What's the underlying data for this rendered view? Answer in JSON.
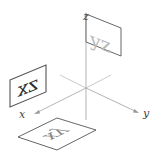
{
  "diagram": {
    "type": "3d-coordinate-projection-planes",
    "axes": [
      {
        "name": "x",
        "label": "x"
      },
      {
        "name": "y",
        "label": "y"
      },
      {
        "name": "z",
        "label": "z"
      }
    ],
    "planes": [
      {
        "name": "yz",
        "text": "yz",
        "color": "#b8b8b8",
        "orientation": "vertical, parallel to y-z plane, behind z-axis top"
      },
      {
        "name": "zx",
        "text": "zx",
        "color": "#333333",
        "orientation": "vertical, parallel to z-x plane, mirrored text"
      },
      {
        "name": "xy",
        "text": "xy",
        "color": "#8a8a8a",
        "orientation": "horizontal, parallel to x-y plane, below origin, mirrored text"
      }
    ],
    "colors": {
      "axis": "#aaaaaa",
      "panel_border": "#555555",
      "background": "#ffffff"
    }
  }
}
